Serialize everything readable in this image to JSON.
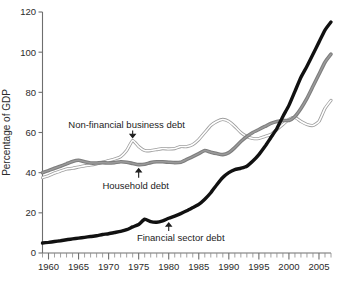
{
  "chart_data": {
    "type": "line",
    "title": "",
    "xlabel": "",
    "ylabel": "Percentage of GDP",
    "xlim": [
      1959,
      2007
    ],
    "ylim": [
      0,
      120
    ],
    "grid": false,
    "legend_position": "inline-annotations",
    "x_tick_labels": [
      "1960",
      "1965",
      "1970",
      "1975",
      "1980",
      "1985",
      "1990",
      "1995",
      "2000",
      "2005"
    ],
    "x_tick_values": [
      1960,
      1965,
      1970,
      1975,
      1980,
      1985,
      1990,
      1995,
      2000,
      2005
    ],
    "x_minor_tick_step": 1,
    "y_tick_labels": [
      "0",
      "20",
      "40",
      "60",
      "80",
      "100",
      "120"
    ],
    "y_tick_values": [
      0,
      20,
      40,
      60,
      80,
      100,
      120
    ],
    "x": [
      1959,
      1960,
      1961,
      1962,
      1963,
      1964,
      1965,
      1966,
      1967,
      1968,
      1969,
      1970,
      1971,
      1972,
      1973,
      1974,
      1975,
      1976,
      1977,
      1978,
      1979,
      1980,
      1981,
      1982,
      1983,
      1984,
      1985,
      1986,
      1987,
      1988,
      1989,
      1990,
      1991,
      1992,
      1993,
      1994,
      1995,
      1996,
      1997,
      1998,
      1999,
      2000,
      2001,
      2002,
      2003,
      2004,
      2005,
      2006,
      2007
    ],
    "series": [
      {
        "name": "Financial sector debt",
        "color": "#111111",
        "style": "thick-black",
        "values": [
          5.0,
          5.3,
          5.7,
          6.1,
          6.6,
          7.0,
          7.4,
          7.8,
          8.2,
          8.6,
          9.2,
          9.6,
          10.2,
          10.8,
          11.6,
          13.0,
          14.2,
          16.8,
          15.6,
          15.3,
          16.0,
          17.3,
          18.4,
          19.6,
          21.0,
          22.6,
          24.2,
          26.8,
          30.0,
          34.0,
          37.6,
          40.0,
          41.5,
          42.2,
          43.2,
          45.8,
          49.0,
          53.0,
          57.5,
          62.0,
          68.0,
          73.5,
          80.5,
          87.5,
          93.0,
          99.0,
          105.0,
          111.0,
          115.0
        ]
      },
      {
        "name": "Household debt",
        "color": "#7d7d7d",
        "style": "thick-gray",
        "values": [
          40.0,
          41.0,
          42.2,
          43.2,
          44.4,
          45.6,
          46.2,
          45.4,
          44.8,
          44.8,
          45.0,
          44.8,
          45.0,
          45.4,
          45.2,
          44.6,
          44.0,
          44.2,
          45.0,
          45.4,
          45.4,
          45.2,
          45.0,
          45.2,
          46.6,
          48.0,
          49.5,
          51.0,
          50.2,
          49.5,
          49.0,
          50.0,
          52.5,
          55.5,
          58.0,
          60.0,
          61.5,
          63.0,
          64.5,
          65.5,
          66.0,
          66.0,
          68.0,
          72.0,
          77.0,
          83.0,
          89.0,
          95.0,
          99.0
        ]
      },
      {
        "name": "Non-financial business debt",
        "color": "#9e9e9e",
        "style": "thin-outline-gray",
        "values": [
          37.5,
          38.5,
          39.8,
          40.8,
          41.8,
          42.2,
          42.8,
          43.4,
          43.8,
          44.4,
          45.2,
          46.0,
          46.8,
          48.0,
          51.0,
          56.0,
          53.0,
          51.0,
          51.0,
          51.5,
          52.0,
          51.8,
          52.0,
          53.0,
          53.0,
          54.0,
          56.5,
          60.0,
          63.5,
          65.5,
          66.5,
          65.5,
          63.0,
          60.0,
          58.0,
          57.0,
          57.0,
          58.0,
          59.0,
          61.5,
          64.0,
          66.5,
          67.5,
          65.5,
          64.0,
          63.5,
          65.5,
          72.0,
          76.0
        ]
      }
    ],
    "annotations": [
      {
        "name": "non-financial-business-debt",
        "text": "Non-financial business debt",
        "label_x": 1973,
        "label_y": 64.0,
        "arrow_x": 1974,
        "arrow_from_y": 61.0,
        "arrow_to_y": 57.5,
        "arrow_direction": "down"
      },
      {
        "name": "household-debt",
        "text": "Household debt",
        "label_x": 1974.5,
        "label_y": 33.5,
        "arrow_x": 1975,
        "arrow_from_y": 37.5,
        "arrow_to_y": 42.0,
        "arrow_direction": "up"
      },
      {
        "name": "financial-sector-debt",
        "text": "Financial sector debt",
        "label_x": 1982,
        "label_y": 7.5,
        "arrow_x": 1980,
        "arrow_from_y": 11.0,
        "arrow_to_y": 15.0,
        "arrow_direction": "up"
      }
    ]
  }
}
